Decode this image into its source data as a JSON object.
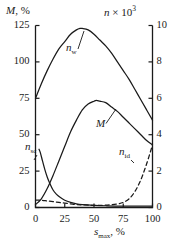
{
  "chart_data": {
    "type": "line",
    "title": "",
    "xlabel": "s_max, %",
    "ylabel": "M, %",
    "y2label": "n × 10³",
    "xlim": [
      0,
      100
    ],
    "ylim": [
      0,
      125
    ],
    "y2lim": [
      0,
      10
    ],
    "grid": false,
    "legend": "inline-labels",
    "xticks": [
      "0",
      "25",
      "50",
      "75",
      "100"
    ],
    "yticks": [
      "0",
      "25",
      "50",
      "75",
      "100",
      "125"
    ],
    "y2ticks": [
      "0",
      "2",
      "4",
      "6",
      "8",
      "10"
    ],
    "series": [
      {
        "name": "n_w",
        "label": "n",
        "sublabel": "w",
        "axis": "right",
        "style": "solid",
        "color": "#1a1a1a",
        "x": [
          0,
          5,
          10,
          15,
          20,
          25,
          30,
          35,
          38,
          40,
          45,
          50,
          55,
          60,
          65,
          70,
          75,
          80,
          85,
          90,
          95,
          100
        ],
        "y": [
          75,
          85,
          94,
          102,
          109,
          114,
          119,
          122,
          123,
          123,
          122,
          119,
          115,
          111,
          106,
          100,
          94,
          88,
          81,
          74,
          67,
          60
        ]
      },
      {
        "name": "M",
        "label": "M",
        "sublabel": "",
        "axis": "left",
        "style": "solid",
        "color": "#1a1a1a",
        "x": [
          0,
          5,
          10,
          15,
          20,
          25,
          30,
          35,
          40,
          45,
          50,
          52,
          55,
          60,
          65,
          70,
          75,
          80,
          85,
          90,
          95,
          100
        ],
        "y": [
          2,
          6,
          13,
          22,
          32,
          42,
          52,
          60,
          67,
          71,
          73,
          73.5,
          73,
          72,
          69,
          66,
          62,
          58,
          54,
          50,
          46,
          43
        ]
      },
      {
        "name": "n_sc",
        "label": "n",
        "sublabel": "sc",
        "axis": "right",
        "style": "solid",
        "color": "#1a1a1a",
        "x": [
          3,
          4,
          6,
          8,
          10,
          12,
          15,
          18,
          21,
          25,
          30,
          35,
          40,
          50,
          60,
          75,
          100
        ],
        "y": [
          40,
          38,
          32,
          26,
          21,
          17,
          12,
          9,
          7,
          5,
          3.5,
          2.5,
          2,
          1.5,
          1.2,
          1,
          1
        ]
      },
      {
        "name": "n_id",
        "label": "n",
        "sublabel": "id",
        "axis": "right",
        "style": "dashed",
        "color": "#1a1a1a",
        "x": [
          0,
          5,
          10,
          15,
          20,
          25,
          30,
          35,
          40,
          50,
          60,
          70,
          75,
          80,
          85,
          90,
          95,
          100
        ],
        "y": [
          5,
          5,
          4.5,
          4,
          3.5,
          3,
          2.5,
          2,
          1.8,
          1.5,
          1.6,
          2.5,
          3.5,
          6,
          11,
          19,
          30,
          43
        ]
      }
    ],
    "annotations": [
      {
        "name": "n_w",
        "text_x": 66,
        "text_y": 42,
        "leader_to_x": 84,
        "leader_to_y": 31
      },
      {
        "name": "M",
        "text_x": 96,
        "text_y": 118,
        "leader_to_x": 116,
        "leader_to_y": 109
      },
      {
        "name": "n_sc",
        "text_x": 25,
        "text_y": 141,
        "leader_to_x": 34,
        "leader_to_y": 160
      },
      {
        "name": "n_id",
        "text_x": 119,
        "text_y": 146,
        "leader_to_x": 134,
        "leader_to_y": 163
      }
    ]
  },
  "axis_titles": {
    "left": {
      "symbol": "M",
      "rest": ", %"
    },
    "right": {
      "symbol": "n",
      "rest": " × 10",
      "exponent": "3"
    },
    "bottom": {
      "symbol": "s",
      "subscript": "max",
      "rest": ", %"
    }
  }
}
